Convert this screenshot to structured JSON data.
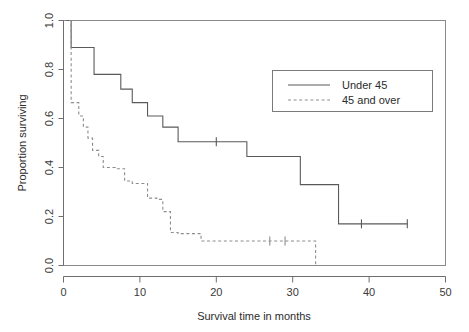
{
  "chart_data": {
    "type": "line",
    "title": "",
    "subtitle": "",
    "xlabel": "Survival time in months",
    "ylabel": "Proportion surviving",
    "xlim": [
      0,
      50
    ],
    "ylim": [
      0.0,
      1.0
    ],
    "xticks": [
      0,
      10,
      20,
      30,
      40,
      50
    ],
    "xtick_labels": [
      "0",
      "10",
      "20",
      "30",
      "40",
      "50"
    ],
    "yticks": [
      0.0,
      0.2,
      0.4,
      0.6,
      0.8,
      1.0
    ],
    "ytick_labels": [
      "0.0",
      "0.2",
      "0.4",
      "0.6",
      "0.8",
      "1.0"
    ],
    "grid": false,
    "legend_position": "upper right",
    "step_style": "post",
    "series": [
      {
        "name": "Under 45",
        "line_style": "solid",
        "color": "#5a5a5a",
        "x": [
          0,
          1,
          4,
          7.5,
          9,
          11,
          13,
          15,
          18,
          24,
          31,
          36,
          45
        ],
        "y": [
          1.0,
          0.89,
          0.78,
          0.72,
          0.665,
          0.61,
          0.565,
          0.505,
          0.505,
          0.445,
          0.33,
          0.17,
          0.17
        ],
        "censored_x": [
          20,
          39,
          45
        ],
        "censored_y": [
          0.505,
          0.17,
          0.17
        ]
      },
      {
        "name": "45 and over",
        "line_style": "dashed",
        "color": "#8d8d8d",
        "x": [
          0,
          1,
          2,
          2.6,
          3.2,
          3.8,
          4.6,
          5.2,
          6.8,
          8,
          9,
          11,
          12.2,
          13,
          14,
          15,
          18,
          33,
          33
        ],
        "y": [
          1.0,
          0.665,
          0.61,
          0.565,
          0.52,
          0.47,
          0.445,
          0.4,
          0.395,
          0.345,
          0.335,
          0.275,
          0.27,
          0.22,
          0.135,
          0.13,
          0.1,
          0.1,
          0.0
        ],
        "censored_x": [
          27,
          29
        ],
        "censored_y": [
          0.1,
          0.1
        ]
      }
    ],
    "legend": [
      {
        "label": "Under 45",
        "line_style": "solid"
      },
      {
        "label": "45 and over",
        "line_style": "dashed"
      }
    ]
  }
}
